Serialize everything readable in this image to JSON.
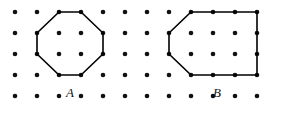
{
  "figure": {
    "background_color": "#ffffff",
    "width": 286,
    "height": 113,
    "grid": {
      "name": "dot-lattice",
      "columns": 12,
      "rows": 5,
      "origin_x": 15,
      "origin_y": 12,
      "spacing_x": 22,
      "spacing_y": 21,
      "dot_radius": 2.3,
      "dot_color": "#111111"
    },
    "shapes": [
      {
        "id": "A",
        "label": "A",
        "name": "octagon-a",
        "type": "octagon",
        "stroke_color": "#000000",
        "stroke_width": 1.6,
        "label_x": 70,
        "label_y": 97,
        "grid_vertices": [
          [
            2,
            0
          ],
          [
            3,
            0
          ],
          [
            4,
            1
          ],
          [
            4,
            2
          ],
          [
            3,
            3
          ],
          [
            2,
            3
          ],
          [
            1,
            2
          ],
          [
            1,
            1
          ]
        ],
        "points": "59,12 81,12 103,33 103,54 81,75 59,75 37,54 37,33"
      },
      {
        "id": "B",
        "label": "B",
        "name": "hexagon-b",
        "type": "hexagon",
        "stroke_color": "#000000",
        "stroke_width": 1.6,
        "label_x": 217,
        "label_y": 97,
        "grid_vertices": [
          [
            8,
            0
          ],
          [
            11,
            0
          ],
          [
            11,
            3
          ],
          [
            8,
            3
          ],
          [
            7,
            2
          ],
          [
            7,
            1
          ]
        ],
        "points": "191,12 257,12 257,75 191,75 169,54 169,33"
      }
    ]
  }
}
